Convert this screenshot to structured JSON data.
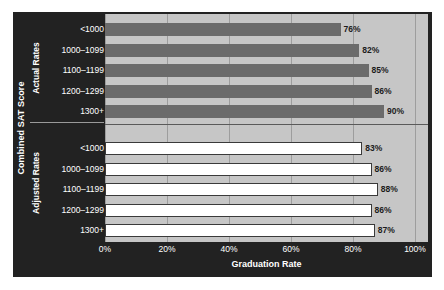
{
  "chart_data": {
    "type": "bar",
    "orientation": "horizontal",
    "title": "",
    "xlabel": "Graduation Rate",
    "ylabel": "Combined SAT Score",
    "xlim": [
      0,
      100
    ],
    "xticks": [
      "0%",
      "20%",
      "40%",
      "60%",
      "80%",
      "100%"
    ],
    "xtick_values": [
      0,
      20,
      40,
      60,
      80,
      100
    ],
    "grid": true,
    "legend": "none",
    "categories": [
      "<1000",
      "1000–1099",
      "1100–1199",
      "1200–1299",
      "1300+"
    ],
    "groups": [
      {
        "name": "Actual Rates",
        "style": "filled-gray",
        "values": [
          76,
          82,
          85,
          86,
          90
        ],
        "labels": [
          "76%",
          "82%",
          "85%",
          "86%",
          "90%"
        ]
      },
      {
        "name": "Adjusted Rates",
        "style": "white-outlined",
        "values": [
          83,
          86,
          88,
          86,
          87
        ],
        "labels": [
          "83%",
          "86%",
          "88%",
          "86%",
          "87%"
        ]
      }
    ],
    "colors": {
      "panel_background": "#222222",
      "plot_background": "#c6c6c6",
      "actual_bar": "#6b6b6b",
      "adjusted_bar": "#ffffff",
      "adjusted_bar_border": "#3a3a3a",
      "gridline": "#9d9d9d",
      "axis_text": "#ffffff",
      "value_text": "#1c1c1c"
    }
  }
}
